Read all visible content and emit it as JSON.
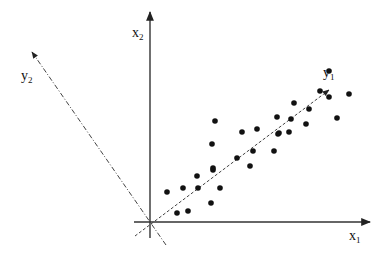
{
  "diagram": {
    "title": "",
    "origin": [
      150,
      222
    ],
    "axes": {
      "x1": {
        "label": "x",
        "subscript": "1",
        "from": [
          134,
          222
        ],
        "to": [
          370,
          222
        ],
        "label_pos": [
          349,
          229
        ]
      },
      "x2": {
        "label": "x",
        "subscript": "2",
        "from": [
          150,
          238
        ],
        "to": [
          150,
          12
        ],
        "label_pos": [
          132,
          26
        ]
      },
      "y1": {
        "label": "y",
        "subscript": "1",
        "from": [
          135,
          236
        ],
        "to": [
          329,
          90
        ],
        "style": "dashed",
        "label_pos": [
          323,
          66
        ]
      },
      "y2": {
        "label": "y",
        "subscript": "2",
        "from": [
          166,
          245
        ],
        "to": [
          32,
          52
        ],
        "style": "dash-dot",
        "label_pos": [
          21,
          69
        ]
      }
    },
    "colors": {
      "line": "#333333",
      "point": "#111111",
      "background": "#ffffff"
    },
    "points": [
      [
        167,
        192
      ],
      [
        183,
        188
      ],
      [
        197,
        176
      ],
      [
        198,
        188
      ],
      [
        220,
        188
      ],
      [
        211,
        203
      ],
      [
        177,
        213
      ],
      [
        188,
        211
      ],
      [
        213,
        170
      ],
      [
        215,
        121
      ],
      [
        242,
        132
      ],
      [
        257,
        129
      ],
      [
        277,
        117
      ],
      [
        278,
        134
      ],
      [
        212,
        144
      ],
      [
        253,
        151
      ],
      [
        274,
        151
      ],
      [
        237,
        158
      ],
      [
        250,
        166
      ],
      [
        213,
        168
      ],
      [
        329,
        71
      ],
      [
        320,
        91
      ],
      [
        329,
        97
      ],
      [
        349,
        94
      ],
      [
        294,
        103
      ],
      [
        309,
        109
      ],
      [
        337,
        118
      ],
      [
        291,
        119
      ],
      [
        306,
        124
      ],
      [
        279,
        133
      ],
      [
        289,
        132
      ]
    ]
  }
}
